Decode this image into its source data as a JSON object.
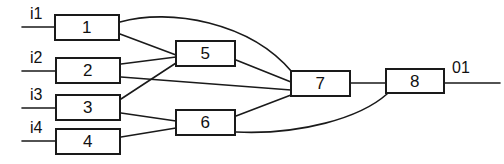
{
  "diagram": {
    "type": "block-flow",
    "stroke_color": "#1a1a1a",
    "background_color": "#ffffff",
    "width": 504,
    "height": 164,
    "inputs": [
      {
        "id": "i1",
        "label": "i1",
        "label_x": 30,
        "label_y": 6,
        "wire": {
          "x1": 22,
          "y1": 27,
          "x2": 54,
          "y2": 27
        }
      },
      {
        "id": "i2",
        "label": "i2",
        "label_x": 30,
        "label_y": 50,
        "wire": {
          "x1": 22,
          "y1": 71,
          "x2": 55,
          "y2": 71
        }
      },
      {
        "id": "i3",
        "label": "i3",
        "label_x": 30,
        "label_y": 87,
        "wire": {
          "x1": 22,
          "y1": 108,
          "x2": 55,
          "y2": 108
        }
      },
      {
        "id": "i4",
        "label": "i4",
        "label_x": 30,
        "label_y": 120,
        "wire": {
          "x1": 22,
          "y1": 141,
          "x2": 55,
          "y2": 141
        }
      }
    ],
    "outputs": [
      {
        "id": "o1",
        "label": "01",
        "label_x": 452,
        "label_y": 60,
        "wire": {
          "x1": 445,
          "y1": 83,
          "x2": 500,
          "y2": 83
        }
      }
    ],
    "nodes": [
      {
        "id": "n1",
        "label": "1",
        "x": 54,
        "y": 14,
        "w": 66,
        "h": 27
      },
      {
        "id": "n2",
        "label": "2",
        "x": 55,
        "y": 57,
        "w": 66,
        "h": 27
      },
      {
        "id": "n3",
        "label": "3",
        "x": 55,
        "y": 94,
        "w": 66,
        "h": 27
      },
      {
        "id": "n4",
        "label": "4",
        "x": 55,
        "y": 128,
        "w": 66,
        "h": 27
      },
      {
        "id": "n5",
        "label": "5",
        "x": 175,
        "y": 40,
        "w": 61,
        "h": 27
      },
      {
        "id": "n6",
        "label": "6",
        "x": 175,
        "y": 109,
        "w": 61,
        "h": 27
      },
      {
        "id": "n7",
        "label": "7",
        "x": 290,
        "y": 70,
        "w": 61,
        "h": 27
      },
      {
        "id": "n8",
        "label": "8",
        "x": 385,
        "y": 68,
        "w": 60,
        "h": 26
      }
    ],
    "edges": [
      {
        "id": "e1",
        "from": "n1",
        "to": "n7",
        "kind": "curve",
        "path": "M120,22 C170,8 250,22 292,72"
      },
      {
        "id": "e2",
        "from": "n1",
        "to": "n5",
        "kind": "line",
        "path": "M120,34 L176,55"
      },
      {
        "id": "e3",
        "from": "n2",
        "to": "n5",
        "kind": "line",
        "path": "M121,64 L176,57"
      },
      {
        "id": "e4",
        "from": "n2",
        "to": "n7",
        "kind": "line",
        "path": "M121,77 L291,90"
      },
      {
        "id": "e5",
        "from": "n3",
        "to": "n5",
        "kind": "line",
        "path": "M121,99 L176,63"
      },
      {
        "id": "e6",
        "from": "n3",
        "to": "n6",
        "kind": "line",
        "path": "M121,113 L176,121"
      },
      {
        "id": "e7",
        "from": "n4",
        "to": "n6",
        "kind": "line",
        "path": "M121,137 L176,128"
      },
      {
        "id": "e8",
        "from": "n5",
        "to": "n7",
        "kind": "line",
        "path": "M236,60 L291,82"
      },
      {
        "id": "e9",
        "from": "n6",
        "to": "n7",
        "kind": "line",
        "path": "M236,116 L291,95"
      },
      {
        "id": "e10",
        "from": "n6",
        "to": "n8",
        "kind": "curve",
        "path": "M236,132 C300,135 360,118 387,94"
      },
      {
        "id": "e11",
        "from": "n7",
        "to": "n8",
        "kind": "line",
        "path": "M351,83 L386,83"
      }
    ]
  }
}
